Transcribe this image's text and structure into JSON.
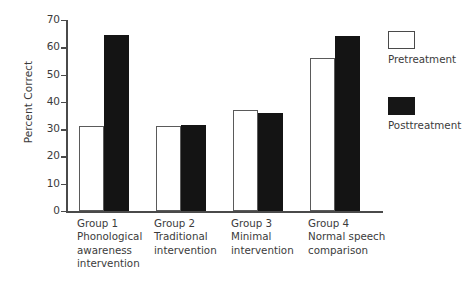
{
  "chart_data": {
    "type": "bar",
    "title": "",
    "xlabel": "",
    "ylabel": "Percent Correct",
    "ylim": [
      0,
      70
    ],
    "yticks": [
      0,
      10,
      20,
      30,
      40,
      50,
      60,
      70
    ],
    "grid": false,
    "legend_position": "right",
    "categories": [
      "Group 1\nPhonological\nawareness\nintervention",
      "Group 2\nTraditional\nintervention",
      "Group 3\nMinimal\nintervention",
      "Group 4\nNormal speech\ncomparison"
    ],
    "series": [
      {
        "name": "Pretreatment",
        "color": "#ffffff",
        "edge_color": "#5a5a5a",
        "values": [
          31,
          31,
          37,
          56
        ]
      },
      {
        "name": "Posttreatment",
        "color": "#141414",
        "edge_color": "#141414",
        "values": [
          64.5,
          31.5,
          36,
          64
        ]
      }
    ]
  },
  "axis": {
    "y_title": "Percent Correct",
    "tick_labels": [
      "70",
      "60",
      "50",
      "40",
      "30",
      "20",
      "10",
      "0"
    ]
  },
  "legend": {
    "items": [
      {
        "label": "Pretreatment",
        "swatch": "white-square-icon"
      },
      {
        "label": "Posttreatment",
        "swatch": "black-square-icon"
      }
    ]
  },
  "groups": [
    {
      "label": "Group 1\nPhonological\nawareness\nintervention"
    },
    {
      "label": "Group 2\nTraditional\nintervention"
    },
    {
      "label": "Group 3\nMinimal\nintervention"
    },
    {
      "label": "Group 4\nNormal speech\ncomparison"
    }
  ]
}
